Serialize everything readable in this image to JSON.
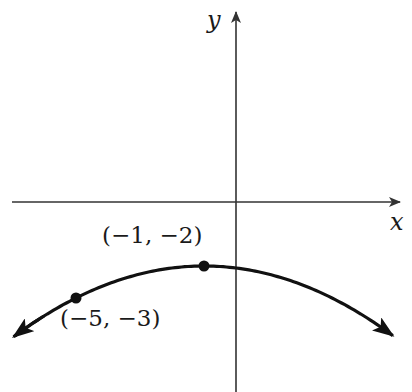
{
  "chart_data": {
    "type": "line",
    "title": "",
    "xlabel": "x",
    "ylabel": "y",
    "function": "y = -2 - (x+1)^2/16",
    "points": [
      {
        "x": -1,
        "y": -2,
        "label": "(−1, −2)"
      },
      {
        "x": -5,
        "y": -3,
        "label": "(−5, −3)"
      }
    ],
    "xlim": [
      -7.0,
      5.4
    ],
    "ylim": [
      -5.9,
      6.3
    ],
    "grid": false,
    "legend": null
  },
  "labels": {
    "x_axis": "x",
    "y_axis": "y",
    "vertex": "(−1, −2)",
    "point2": "(−5, −3)"
  },
  "colors": {
    "curve": "#111111",
    "axis": "#333333"
  }
}
